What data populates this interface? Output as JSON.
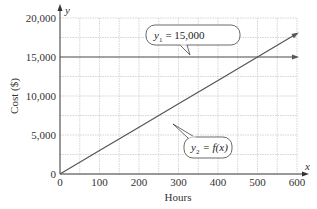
{
  "chart_data": {
    "type": "line",
    "title": "",
    "xlabel": "Hours",
    "ylabel": "Cost ($)",
    "x_axis_var": "x",
    "y_axis_var": "y",
    "xlim": [
      0,
      600
    ],
    "ylim": [
      0,
      20000
    ],
    "x_ticks": [
      "0",
      "100",
      "200",
      "300",
      "400",
      "500",
      "600"
    ],
    "y_ticks": [
      "0",
      "5,000",
      "10,000",
      "15,000",
      "20,000"
    ],
    "grid": true,
    "series": [
      {
        "name": "y1 = 15,000",
        "label_sub": "1",
        "label_rhs": "= 15,000",
        "x": [
          0,
          600
        ],
        "values": [
          15000,
          15000
        ]
      },
      {
        "name": "y2 = f(x)",
        "label_sub": "2",
        "label_rhs": "= f(x)",
        "x": [
          0,
          100,
          200,
          300,
          400,
          500,
          600
        ],
        "values": [
          0,
          3000,
          6000,
          9000,
          12000,
          15000,
          18000
        ]
      }
    ],
    "annotations": [
      "y1 = 15,000",
      "y2 = f(x)"
    ],
    "intersection": {
      "x": 500,
      "y": 15000
    }
  },
  "colors": {
    "line": "#555555",
    "grid": "#bbbbbb",
    "axis": "#333333"
  }
}
